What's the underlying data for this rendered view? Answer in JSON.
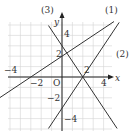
{
  "diagram": {
    "type": "coordinate-plane",
    "origin_label": "O",
    "x_axis_label": "x",
    "y_axis_label": "y",
    "x_ticks": [
      {
        "value": -4,
        "label": "−4"
      },
      {
        "value": -2,
        "label": "−2"
      },
      {
        "value": 2,
        "label": "2"
      },
      {
        "value": 4,
        "label": "4"
      }
    ],
    "y_ticks": [
      {
        "value": 4,
        "label": "4"
      },
      {
        "value": 2,
        "label": "2"
      },
      {
        "value": -2,
        "label": "−2"
      },
      {
        "value": -4,
        "label": "−4"
      }
    ],
    "grid": {
      "x_min": -6,
      "x_max": 6,
      "y_min": -5,
      "y_max": 5,
      "step": 1
    },
    "lines": [
      {
        "label": "(1)",
        "slope": 0.6667,
        "intercept": 2,
        "x_from": -6,
        "x_to": 5
      },
      {
        "label": "(2)",
        "slope": 1.5,
        "intercept": -3,
        "x_from": -1.3,
        "x_to": 5.5
      },
      {
        "label": "(3)",
        "slope": -1.5,
        "intercept": 3,
        "x_from": -1.3,
        "x_to": 5.3
      }
    ],
    "colors": {
      "line": "#333333",
      "grid": "#d4d4d4",
      "axis": "#222222",
      "background": "#ffffff"
    }
  }
}
